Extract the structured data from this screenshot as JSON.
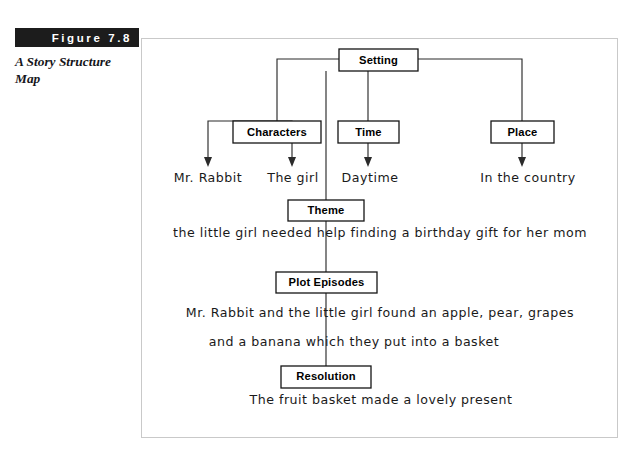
{
  "figure": {
    "banner_label": "Figure 7.8",
    "subtitle": "A Story Structure Map"
  },
  "diagram": {
    "type": "hierarchy-story-structure-map",
    "nodes": {
      "setting": "Setting",
      "characters": "Characters",
      "time": "Time",
      "place": "Place",
      "theme": "Theme",
      "plot_episodes": "Plot Episodes",
      "resolution": "Resolution"
    },
    "leaves": {
      "character_1": "Mr. Rabbit",
      "character_2": "The girl",
      "time_value": "Daytime",
      "place_value": "In the country"
    },
    "responses": {
      "theme_text": "the little girl needed help finding a birthday gift for her mom",
      "plot_line_1": "Mr. Rabbit and the little girl found an apple, pear, grapes",
      "plot_line_2": "and a banana which they put into a basket",
      "resolution_text": "The fruit basket made a lovely present"
    },
    "colors": {
      "node_stroke": "#151515",
      "connector": "#2b2b2b",
      "frame_border": "#c9c9c9",
      "banner_bg": "#1c1c1c",
      "banner_text": "#ffffff",
      "handwriting": "#1a1a1a"
    }
  }
}
